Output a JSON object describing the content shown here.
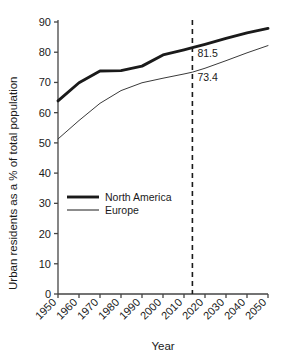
{
  "chart_data": {
    "type": "line",
    "title": "",
    "xlabel": "Year",
    "ylabel": "Urban residents as a % of total population",
    "xlim": [
      1950,
      2050
    ],
    "ylim": [
      0,
      90
    ],
    "grid": false,
    "legend_position": "inside-left-center",
    "xticks": [
      "1950",
      "1960",
      "1970",
      "1980",
      "1990",
      "2000",
      "2010",
      "2020",
      "2030",
      "2040",
      "2050"
    ],
    "yticks": [
      "0",
      "10",
      "20",
      "30",
      "40",
      "50",
      "60",
      "70",
      "80",
      "90"
    ],
    "x": [
      1950,
      1960,
      1970,
      1980,
      1990,
      2000,
      2010,
      2014,
      2020,
      2030,
      2040,
      2050
    ],
    "series": [
      {
        "name": "North America",
        "style": "thick",
        "color": "#1a1a1a",
        "values": [
          63.9,
          69.9,
          73.8,
          73.9,
          75.4,
          79.1,
          80.8,
          81.5,
          82.6,
          84.6,
          86.4,
          87.9
        ]
      },
      {
        "name": "Europe",
        "style": "thin",
        "color": "#3a3a3a",
        "values": [
          51.3,
          57.4,
          63.1,
          67.3,
          69.9,
          71.4,
          72.8,
          73.4,
          74.7,
          77.2,
          79.8,
          82.2
        ]
      }
    ],
    "annotations": [
      {
        "label": "81.5",
        "x": 2014,
        "y": 81.5,
        "series": "North America"
      },
      {
        "label": "73.4",
        "x": 2014,
        "y": 73.4,
        "series": "Europe"
      }
    ],
    "reference_line": {
      "x": 2014,
      "style": "dashed",
      "color": "#1a1a1a"
    },
    "legend": [
      {
        "label": "North America",
        "style": "thick"
      },
      {
        "label": "Europe",
        "style": "thin"
      }
    ]
  }
}
